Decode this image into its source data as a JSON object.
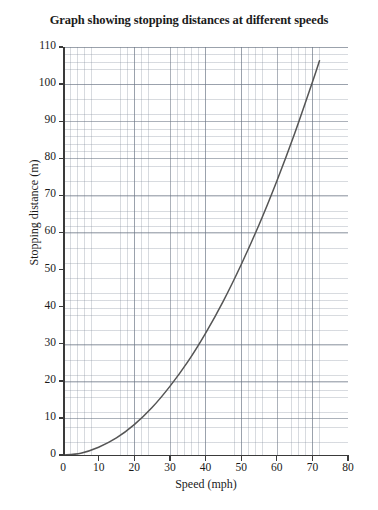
{
  "chart_data": {
    "type": "line",
    "title": "Graph showing stopping distances at different speeds",
    "xlabel": "Speed (mph)",
    "ylabel": "Stopping distance (m)",
    "xlim": [
      0,
      80
    ],
    "ylim": [
      0,
      110
    ],
    "xticks": [
      0,
      10,
      20,
      30,
      40,
      50,
      60,
      70,
      80
    ],
    "yticks": [
      0,
      10,
      20,
      30,
      40,
      50,
      60,
      70,
      80,
      90,
      100,
      110
    ],
    "grid": "graph-paper minor gridlines with major gridlines at each labelled tick",
    "legend": "none",
    "series": [
      {
        "name": "Stopping distance",
        "color": "#555555",
        "x": [
          0,
          5,
          10,
          15,
          20,
          25,
          30,
          35,
          40,
          45,
          50,
          55,
          60,
          65,
          70,
          72
        ],
        "values": [
          0,
          0.5,
          2.1,
          4.6,
          8.2,
          12.8,
          18.5,
          25.1,
          32.8,
          41.5,
          51.3,
          62.0,
          73.8,
          86.6,
          100.5,
          106.3
        ]
      }
    ],
    "annotations": []
  },
  "chart": {
    "title": "Graph showing stopping distances at different speeds",
    "x_axis_title": "Speed (mph)",
    "y_axis_title": "Stopping distance (m)",
    "x_tick_labels": [
      "0",
      "10",
      "20",
      "30",
      "40",
      "50",
      "60",
      "70",
      "80"
    ],
    "y_tick_labels": [
      "0",
      "10",
      "20",
      "30",
      "40",
      "50",
      "60",
      "70",
      "80",
      "90",
      "100",
      "110"
    ],
    "curve_color": "#555555",
    "axis_color": "#3a3a3a",
    "grid_color": "#7d8796",
    "background": "#ffffff"
  }
}
